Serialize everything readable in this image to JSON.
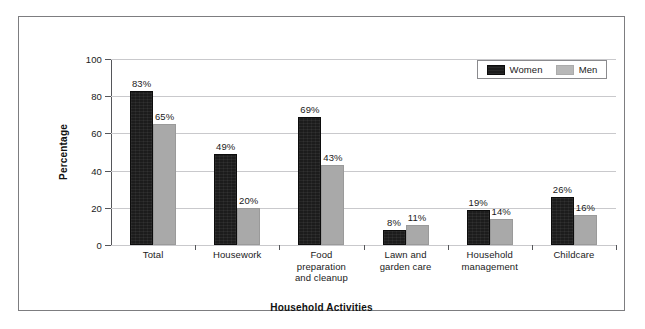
{
  "chart_data": {
    "type": "bar",
    "title": "",
    "xlabel": "Household Activities",
    "ylabel": "Percentage",
    "ylim": [
      0,
      100
    ],
    "yticks": [
      0,
      20,
      40,
      60,
      80,
      100
    ],
    "grid": true,
    "legend_position": "top-right",
    "categories": [
      "Total",
      "Housework",
      "Food preparation and cleanup",
      "Lawn and garden care",
      "Household management",
      "Childcare"
    ],
    "category_lines": [
      [
        "Total"
      ],
      [
        "Housework"
      ],
      [
        "Food",
        "preparation",
        "and cleanup"
      ],
      [
        "Lawn and",
        "garden care"
      ],
      [
        "Household",
        "management"
      ],
      [
        "Childcare"
      ]
    ],
    "series": [
      {
        "name": "Women",
        "color": "#1c1c1c",
        "values": [
          83,
          49,
          69,
          8,
          19,
          26
        ],
        "labels": [
          "83%",
          "49%",
          "69%",
          "8%",
          "19%",
          "26%"
        ]
      },
      {
        "name": "Men",
        "color": "#a9a9a9",
        "values": [
          65,
          20,
          43,
          11,
          14,
          16
        ],
        "labels": [
          "65%",
          "20%",
          "43%",
          "11%",
          "14%",
          "16%"
        ]
      }
    ]
  },
  "axis": {
    "y_tick_labels": [
      "0",
      "20",
      "40",
      "60",
      "80",
      "100"
    ],
    "y_title": "Percentage",
    "x_title": "Household Activities"
  },
  "legend": {
    "items": [
      {
        "label": "Women",
        "swatch": "women-swatch-icon"
      },
      {
        "label": "Men",
        "swatch": "men-swatch-icon"
      }
    ]
  }
}
